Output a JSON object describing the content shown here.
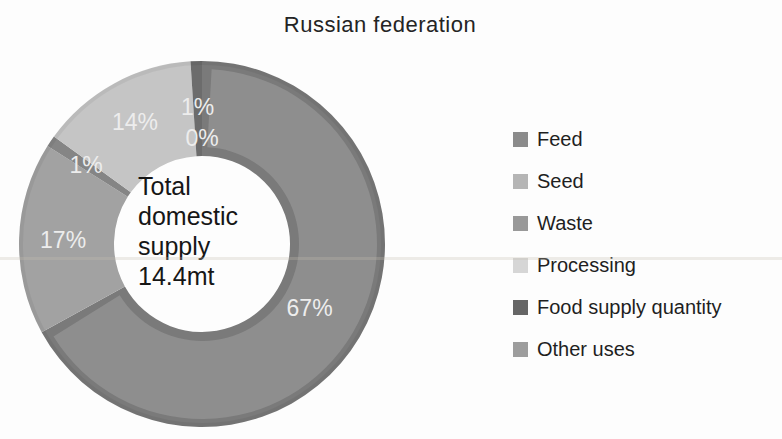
{
  "chart_data": {
    "type": "pie",
    "variant": "donut",
    "title": "Russian federation",
    "center_label": [
      "Total",
      "domestic",
      "supply",
      "14.4mt"
    ],
    "unit": "%",
    "direction": "clockwise",
    "start_angle_deg": 0,
    "legend_position": "right",
    "label_color": "#ededed",
    "slices": [
      {
        "name": "Feed",
        "value": 67,
        "color": "#8e8e8e",
        "rim_color": "#7a7a7a",
        "label_r": 125,
        "label_size": 25
      },
      {
        "name": "Seed",
        "value": 17,
        "color": "#a2a2a2",
        "label_r": 139
      },
      {
        "name": "Waste",
        "value": 1,
        "color": "#858585",
        "label_r": 140
      },
      {
        "name": "Processing",
        "value": 14,
        "color": "#c5c5c5",
        "label_r": 139
      },
      {
        "name": "Food supply quantity",
        "value": 1,
        "color": "#6c6c6c",
        "label_r": 137
      },
      {
        "name": "Other uses",
        "value": 0,
        "color": "#9e9e9e",
        "label_r": 106
      }
    ]
  },
  "legend": {
    "items": [
      {
        "label": "Feed",
        "swatch": "#8b8b8b"
      },
      {
        "label": "Seed",
        "swatch": "#b5b5b5"
      },
      {
        "label": "Waste",
        "swatch": "#999999"
      },
      {
        "label": "Processing",
        "swatch": "#d6d6d6"
      },
      {
        "label": "Food supply quantity",
        "swatch": "#666666"
      },
      {
        "label": "Other uses",
        "swatch": "#9d9d9d"
      }
    ]
  }
}
